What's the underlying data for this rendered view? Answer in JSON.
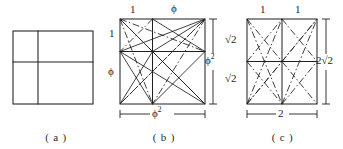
{
  "document": {
    "kind": "geometric-figure",
    "background_color": "#ffffff",
    "ink_color": "#1a1a1a"
  },
  "panels": [
    {
      "id": "a",
      "caption": "( a )",
      "shape": "rectangle-with-cross-partition",
      "labels": []
    },
    {
      "id": "b",
      "caption": "( b )",
      "shape": "square-with-grid-and-diagonals",
      "labels": [
        {
          "name": "top-left",
          "text": "1"
        },
        {
          "name": "top-right",
          "text": "ϕ"
        },
        {
          "name": "left-upper",
          "text": "1"
        },
        {
          "name": "left-lower",
          "text": "ϕ"
        },
        {
          "name": "right-side",
          "text": "ϕ²"
        },
        {
          "name": "bottom",
          "text": "ϕ²"
        }
      ]
    },
    {
      "id": "c",
      "caption": "( c )",
      "shape": "rectangle-with-grid-and-diagonals",
      "labels": [
        {
          "name": "top-left",
          "text": "1"
        },
        {
          "name": "top-right",
          "text": "1"
        },
        {
          "name": "left-upper",
          "text": "√2"
        },
        {
          "name": "left-lower",
          "text": "√2"
        },
        {
          "name": "right-side",
          "text": "2√2"
        },
        {
          "name": "bottom",
          "text": "2"
        }
      ]
    }
  ],
  "labels_flat": {
    "a_caption": "( a )",
    "b_caption": "( b )",
    "c_caption": "( c )",
    "b_top_left": "1",
    "b_top_right": "ϕ",
    "b_left_upper": "1",
    "b_left_lower": "ϕ",
    "b_right": "ϕ",
    "b_right_sup": "2",
    "b_bottom": "ϕ",
    "b_bottom_sup": "2",
    "c_top_left": "1",
    "c_top_right": "1",
    "c_left_upper": "√2",
    "c_left_lower": "√2",
    "c_right": "2√2",
    "c_bottom": "2"
  }
}
